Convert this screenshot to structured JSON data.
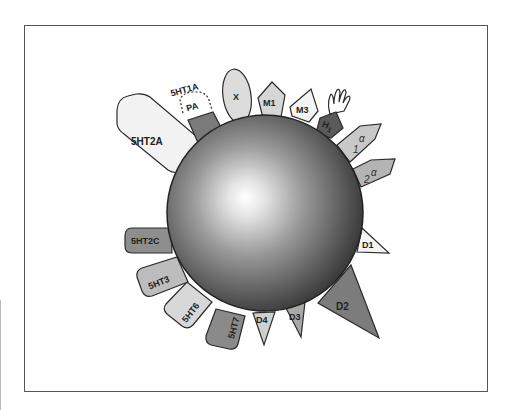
{
  "diagram": {
    "type": "receptor-binding-profile",
    "center": {
      "label": "",
      "shape": "sphere"
    },
    "receptors": [
      {
        "id": "5HT2A",
        "label": "5HT2A",
        "fill": "#f2f2f2"
      },
      {
        "id": "5HT1A",
        "label": "5HT1A",
        "sublabel": "PA",
        "fill": "#7a7a7a",
        "note": "partial agonist (dashed outline)"
      },
      {
        "id": "X",
        "label": "X",
        "fill": "#dcdcdc"
      },
      {
        "id": "M1",
        "label": "M1",
        "fill": "#d6d6d6"
      },
      {
        "id": "M3",
        "label": "M3",
        "fill": "#f4f4f4"
      },
      {
        "id": "H1",
        "label": "H",
        "subscript": "1",
        "fill": "#5a5a5a"
      },
      {
        "id": "alpha1",
        "label": "1",
        "glyph": "α",
        "fill": "#c8c8c8"
      },
      {
        "id": "alpha2",
        "label": "2",
        "glyph": "α",
        "fill": "#b4b4b4"
      },
      {
        "id": "D1",
        "label": "D1",
        "fill": "#f4f4f4"
      },
      {
        "id": "D2",
        "label": "D2",
        "fill": "#7c7c7c"
      },
      {
        "id": "D3",
        "label": "D3",
        "fill": "#a8a8a8"
      },
      {
        "id": "D4",
        "label": "D4",
        "fill": "#cfcfcf"
      },
      {
        "id": "5HT7",
        "label": "5HT7",
        "fill": "#8a8a8a"
      },
      {
        "id": "5HT6",
        "label": "5HT6",
        "fill": "#d8d8d8"
      },
      {
        "id": "5HT3",
        "label": "5HT3",
        "fill": "#bdbdbd"
      },
      {
        "id": "5HT2C",
        "label": "5HT2C",
        "fill": "#8e8e8e"
      }
    ]
  },
  "colors": {
    "frame": "#555555",
    "outline": "#2a2a2a",
    "sphere_highlight": "#ffffff",
    "sphere_shadow": "#2e2e2e"
  }
}
